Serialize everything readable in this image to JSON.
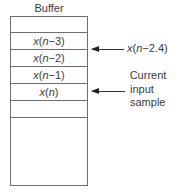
{
  "diagram": {
    "title": "Buffer",
    "rows": [
      {
        "text": ""
      },
      {
        "var": "x",
        "arg_var": "n",
        "arg_rest": "−3"
      },
      {
        "var": "x",
        "arg_var": "n",
        "arg_rest": "−2"
      },
      {
        "var": "x",
        "arg_var": "n",
        "arg_rest": "−1"
      },
      {
        "var": "x",
        "arg_var": "n",
        "arg_rest": ""
      },
      {
        "text": ""
      },
      {
        "text": ""
      }
    ],
    "annotations": [
      {
        "target_row": "between x(n-3) and x(n-2)",
        "var": "x",
        "arg_var": "n",
        "arg_rest": "−2.4"
      },
      {
        "target_row": "x(n)",
        "lines": [
          "Current",
          "input",
          "sample"
        ]
      }
    ],
    "colors": {
      "line": "#6e6e6e",
      "text": "#3a3a3a",
      "arrow": "#222222"
    }
  }
}
